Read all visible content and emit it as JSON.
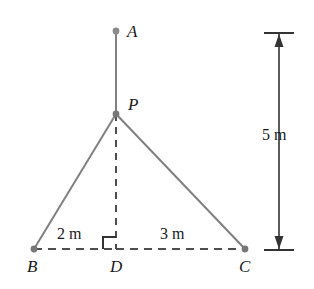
{
  "figure": {
    "type": "geometry-diagram",
    "background_color": "#ffffff",
    "line_color": "#808080",
    "dash_color": "#4d4d4d",
    "dimension_color": "#333333",
    "text_color": "#1a1a1a",
    "points": [
      {
        "id": "A",
        "label": "A",
        "x": 116,
        "y": 31,
        "label_x": 127,
        "label_y": 23,
        "dot": true
      },
      {
        "id": "P",
        "label": "P",
        "x": 116,
        "y": 114,
        "label_x": 128,
        "label_y": 96,
        "dot": true
      },
      {
        "id": "B",
        "label": "B",
        "x": 34,
        "y": 249,
        "label_x": 27,
        "label_y": 258,
        "dot": true
      },
      {
        "id": "D",
        "label": "D",
        "x": 116,
        "y": 249,
        "label_x": 110,
        "label_y": 258,
        "dot": false
      },
      {
        "id": "C",
        "label": "C",
        "x": 245,
        "y": 249,
        "label_x": 239,
        "label_y": 258,
        "dot": true
      }
    ],
    "segments": [
      {
        "id": "AP",
        "from": "A",
        "to": "P",
        "style": "solid"
      },
      {
        "id": "PB",
        "from": "P",
        "to": "B",
        "style": "solid"
      },
      {
        "id": "PC",
        "from": "P",
        "to": "C",
        "style": "solid"
      },
      {
        "id": "PD",
        "from": "P",
        "to": "D",
        "style": "dashed"
      },
      {
        "id": "BC",
        "from": "B",
        "to": "C",
        "style": "dashed"
      }
    ],
    "right_angle": {
      "at": "D",
      "size": 13,
      "label": "right-angle-marker"
    },
    "measurements": [
      {
        "id": "BD",
        "text": "2 m",
        "x": 57,
        "y": 226
      },
      {
        "id": "DC",
        "text": "3 m",
        "x": 160,
        "y": 226
      },
      {
        "id": "vertical",
        "text": "5 m",
        "x": 262,
        "y": 127
      }
    ],
    "dimension_line": {
      "id": "height-dimension",
      "x": 279,
      "y_top": 33,
      "y_bottom": 250,
      "tick_half_width": 15,
      "arrow_both_ends": true
    }
  }
}
